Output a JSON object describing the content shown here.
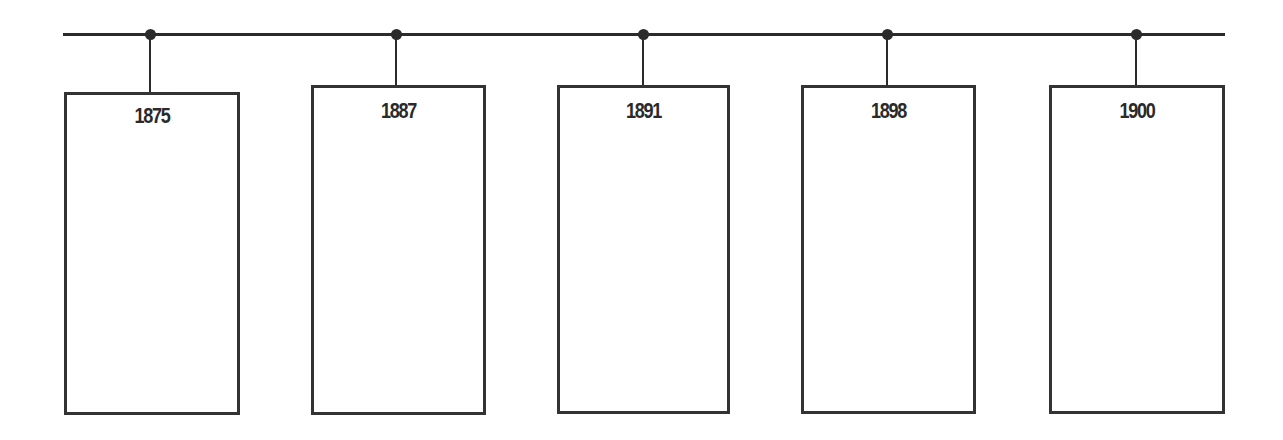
{
  "timeline": {
    "line_color": "#2b2b2b",
    "events": [
      {
        "year": "1875",
        "content": ""
      },
      {
        "year": "1887",
        "content": ""
      },
      {
        "year": "1891",
        "content": ""
      },
      {
        "year": "1898",
        "content": ""
      },
      {
        "year": "1900",
        "content": ""
      }
    ]
  }
}
